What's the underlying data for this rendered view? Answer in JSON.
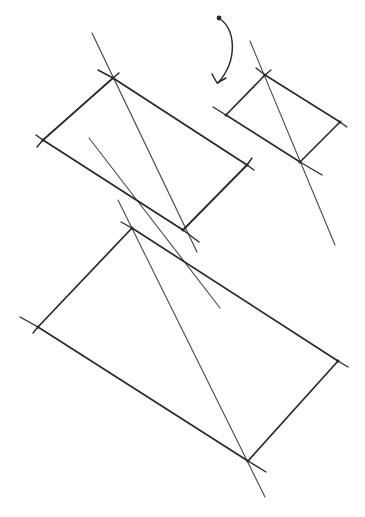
{
  "sketch": {
    "background": "#ffffff",
    "ink": "#2a2a2a",
    "ink_light": "#4a4a4a",
    "shapes": [
      {
        "name": "large-upper-rectangle",
        "corners": [
          [
            113,
            78
          ],
          [
            247,
            165
          ],
          [
            183,
            230
          ],
          [
            43,
            140
          ]
        ],
        "overshoots": [
          [
            [
              98,
              70
            ],
            [
              113,
              78
            ]
          ],
          [
            [
              113,
              78
            ],
            [
              119,
              73
            ]
          ],
          [
            [
              247,
              165
            ],
            [
              254,
              170
            ]
          ],
          [
            [
              247,
              165
            ],
            [
              252,
              158
            ]
          ],
          [
            [
              183,
              230
            ],
            [
              199,
              242
            ]
          ],
          [
            [
              36,
              135
            ],
            [
              43,
              140
            ]
          ],
          [
            [
              43,
              140
            ],
            [
              37,
              147
            ]
          ]
        ],
        "stroke_width": 1.8
      },
      {
        "name": "small-right-rectangle",
        "corners": [
          [
            265,
            75
          ],
          [
            340,
            122
          ],
          [
            300,
            162
          ],
          [
            226,
            115
          ]
        ],
        "overshoots": [
          [
            [
              256,
              68
            ],
            [
              265,
              75
            ]
          ],
          [
            [
              265,
              75
            ],
            [
              271,
              70
            ]
          ],
          [
            [
              340,
              122
            ],
            [
              347,
              127
            ]
          ],
          [
            [
              213,
              107
            ],
            [
              226,
              115
            ]
          ],
          [
            [
              300,
              162
            ],
            [
              322,
              175
            ]
          ]
        ],
        "stroke_width": 1.6
      },
      {
        "name": "large-lower-rectangle",
        "corners": [
          [
            132,
            228
          ],
          [
            338,
            361
          ],
          [
            248,
            461
          ],
          [
            38,
            327
          ]
        ],
        "overshoots": [
          [
            [
              121,
              222
            ],
            [
              132,
              228
            ]
          ],
          [
            [
              338,
              361
            ],
            [
              348,
              367
            ]
          ],
          [
            [
              248,
              461
            ],
            [
              266,
              472
            ]
          ],
          [
            [
              20,
              317
            ],
            [
              38,
              327
            ]
          ],
          [
            [
              38,
              327
            ],
            [
              33,
              333
            ]
          ]
        ],
        "stroke_width": 1.7
      }
    ],
    "diagonals": [
      {
        "name": "upper-rect-diagonal",
        "from": [
          92,
          33
        ],
        "to": [
          197,
          252
        ],
        "stroke_width": 1.2
      },
      {
        "name": "middle-long-diagonal",
        "from": [
          89,
          138
        ],
        "to": [
          220,
          308
        ],
        "stroke_width": 1.1
      },
      {
        "name": "small-rect-diagonal",
        "from": [
          250,
          41
        ],
        "to": [
          335,
          245
        ],
        "stroke_width": 1.1
      },
      {
        "name": "lower-rect-diagonal",
        "from": [
          118,
          200
        ],
        "to": [
          265,
          497
        ],
        "stroke_width": 1.1
      }
    ],
    "arrow": {
      "name": "curved-arrow",
      "path": "M219 18 C 236 30, 238 60, 218 83",
      "head": [
        [
          212,
          74
        ],
        [
          217,
          83
        ],
        [
          226,
          78
        ]
      ],
      "dot": [
        219,
        18
      ],
      "stroke_width": 1.5
    }
  }
}
